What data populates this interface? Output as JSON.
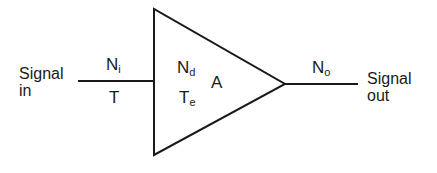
{
  "diagram": {
    "type": "amplifier-noise-block",
    "input": {
      "label_line1": "Signal",
      "label_line2": "in",
      "noise_symbol": "N",
      "noise_sub": "i",
      "temp_symbol": "T"
    },
    "amplifier": {
      "noise_symbol": "N",
      "noise_sub": "d",
      "temp_symbol": "T",
      "temp_sub": "e",
      "gain_symbol": "A"
    },
    "output": {
      "label_line1": "Signal",
      "label_line2": "out",
      "noise_symbol": "N",
      "noise_sub": "o"
    },
    "colors": {
      "stroke": "#1a1a1a",
      "background": "#ffffff"
    }
  }
}
